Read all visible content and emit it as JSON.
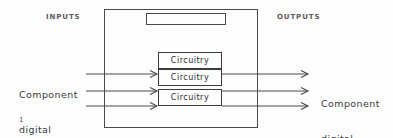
{
  "diagram": {
    "figure_number": "1",
    "inputs_label": "INPUTS",
    "outputs_label": "OUTPUTS",
    "input_signal": {
      "line1": "Component",
      "line2": "digital"
    },
    "output_signal": {
      "line1": "Component",
      "line2": "digital"
    },
    "enclosure": {
      "name": "outer-enclosure",
      "top_module_label": ""
    },
    "circuitry_blocks": [
      {
        "label": "Circuitry"
      },
      {
        "label": "Circuitry"
      },
      {
        "label": "Circuitry"
      }
    ],
    "colors": {
      "background": "#fdfdfd",
      "line": "#4a4a4a",
      "text": "#2b2b2b",
      "label_text": "#5a5a5a"
    }
  }
}
